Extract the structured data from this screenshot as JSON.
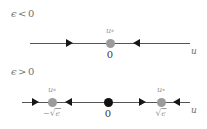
{
  "figure": {
    "type": "bifurcation-phase-line-diagram",
    "width": 207,
    "height": 129,
    "background": "#ffffff"
  },
  "colors": {
    "axis": "#555555",
    "arrow": "#161616",
    "stable_point": "#9b9b9b",
    "unstable_point": "#111111",
    "label_gray": "#9a9a9a",
    "label_dark": "#3a3a3a",
    "cond_text": "#6f6f6f"
  },
  "panels": [
    {
      "id": "panel-epsilon-negative",
      "condition": {
        "symbol": "ϵ",
        "relation": "<",
        "value": "0",
        "full": "ϵ < 0"
      },
      "axis_variable": "u",
      "points": [
        {
          "id": "origin",
          "label_above": "u",
          "label_above_sub": "*",
          "label_below": "0",
          "stability": "stable",
          "color": "#9b9b9b"
        }
      ],
      "arrows": [
        {
          "direction": "right"
        },
        {
          "direction": "left"
        }
      ]
    },
    {
      "id": "panel-epsilon-positive",
      "condition": {
        "symbol": "ϵ",
        "relation": ">",
        "value": "0",
        "full": "ϵ > 0"
      },
      "axis_variable": "u",
      "points": [
        {
          "id": "negative-root",
          "label_above": "u",
          "label_above_sub": "*",
          "label_below_sign": "−",
          "label_below_radical": "√",
          "label_below_arg": "ϵ",
          "label_below": "−√ϵ",
          "stability": "stable",
          "color": "#9b9b9b"
        },
        {
          "id": "origin",
          "label_above": "",
          "label_below": "0",
          "stability": "unstable",
          "color": "#111111"
        },
        {
          "id": "positive-root",
          "label_above": "u",
          "label_above_sub": "*",
          "label_below_sign": "",
          "label_below_radical": "√",
          "label_below_arg": "ϵ",
          "label_below": "√ϵ",
          "stability": "stable",
          "color": "#9b9b9b"
        }
      ],
      "arrows": [
        {
          "direction": "right"
        },
        {
          "direction": "left"
        },
        {
          "direction": "right"
        },
        {
          "direction": "left"
        }
      ]
    }
  ]
}
